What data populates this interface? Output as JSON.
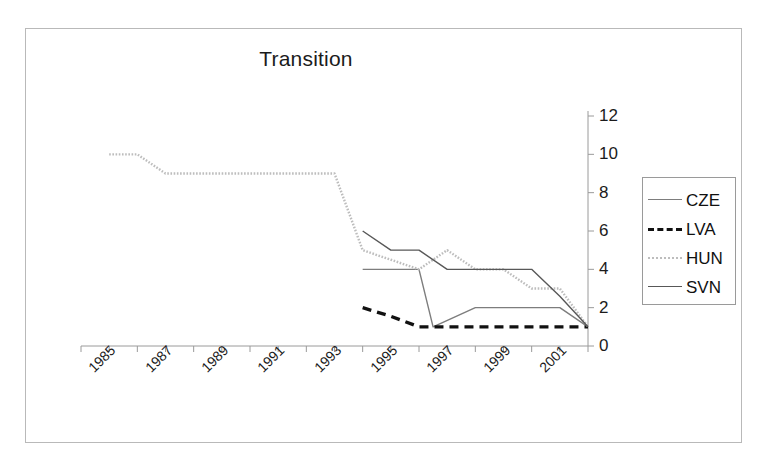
{
  "chart_data": {
    "type": "line",
    "title": "Transition",
    "xlabel": "",
    "ylabel": "",
    "ylim": [
      0,
      12
    ],
    "ytick_values": [
      0,
      2,
      4,
      6,
      8,
      10,
      12
    ],
    "ytick_labels": [
      "0",
      "2",
      "4",
      "6",
      "8",
      "10",
      "12"
    ],
    "yaxis_position": "right",
    "xlim": [
      1984,
      2002
    ],
    "xtick_labels": [
      "1985",
      "1987",
      "1989",
      "1991",
      "1993",
      "1995",
      "1997",
      "1999",
      "2001"
    ],
    "xtick_values": [
      1985,
      1987,
      1989,
      1991,
      1993,
      1995,
      1997,
      1999,
      2001
    ],
    "xtick_rotation": -45,
    "grid": false,
    "legend_position": "right",
    "series": [
      {
        "name": "CZE",
        "color": "#7d7d7d",
        "style": "solid",
        "x": [
          1994,
          1995,
          1996,
          1996.5,
          1998,
          1999,
          2000,
          2001,
          2002
        ],
        "values": [
          4,
          4,
          4,
          1,
          2,
          2,
          2,
          2,
          1
        ]
      },
      {
        "name": "LVA",
        "color": "#111111",
        "style": "dashed",
        "x": [
          1994,
          1995,
          1996,
          1997,
          1998,
          1999,
          2000,
          2001,
          2002
        ],
        "values": [
          2,
          1.55,
          1,
          1,
          1,
          1,
          1,
          1,
          1
        ]
      },
      {
        "name": "HUN",
        "color": "#bdbdbd",
        "style": "dotted",
        "x": [
          1985,
          1986,
          1987,
          1988,
          1989,
          1990,
          1991,
          1992,
          1993,
          1994,
          1995,
          1996,
          1997,
          1998,
          1999,
          2000,
          2001,
          2002
        ],
        "values": [
          10,
          10,
          9,
          9,
          9,
          9,
          9,
          9,
          9,
          5,
          4.5,
          4,
          5,
          4,
          4,
          3,
          3,
          1
        ]
      },
      {
        "name": "SVN",
        "color": "#585858",
        "style": "solid",
        "x": [
          1994,
          1995,
          1996,
          1997,
          1998,
          1999,
          2000,
          2001,
          2002
        ],
        "values": [
          6,
          5,
          5,
          4,
          4,
          4,
          4,
          2.6,
          1
        ]
      }
    ]
  },
  "legend": {
    "items": [
      {
        "label": "CZE",
        "swatch": "line-solid-gray-swatch"
      },
      {
        "label": "LVA",
        "swatch": "line-dashed-black-swatch"
      },
      {
        "label": "HUN",
        "swatch": "line-dotted-lightgray-swatch"
      },
      {
        "label": "SVN",
        "swatch": "line-solid-darkgray-swatch"
      }
    ]
  }
}
